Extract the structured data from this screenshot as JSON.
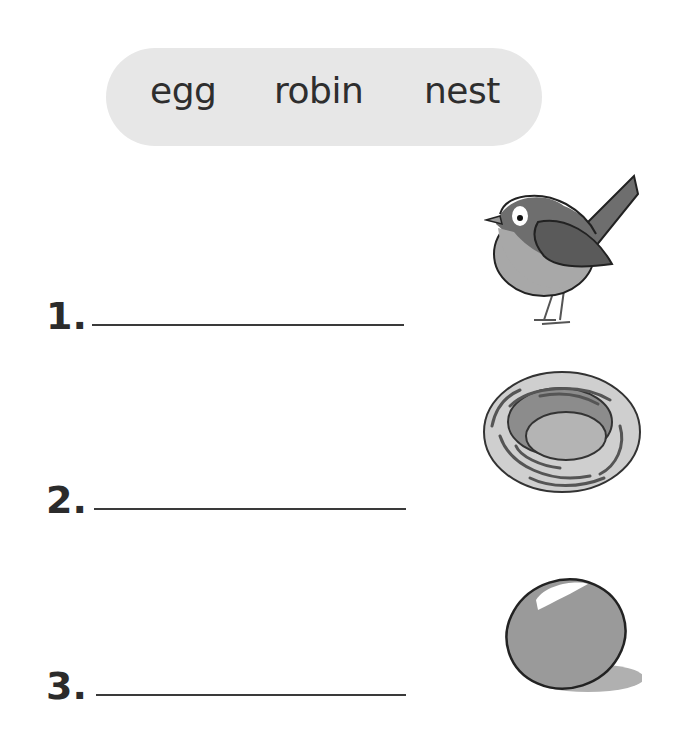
{
  "word_bank": {
    "words": [
      "egg",
      "robin",
      "nest"
    ],
    "background_color": "#e7e7e7"
  },
  "items": [
    {
      "number": "1.",
      "answer": "",
      "picture": "robin-icon"
    },
    {
      "number": "2.",
      "answer": "",
      "picture": "nest-icon"
    },
    {
      "number": "3.",
      "answer": "",
      "picture": "egg-icon"
    }
  ]
}
